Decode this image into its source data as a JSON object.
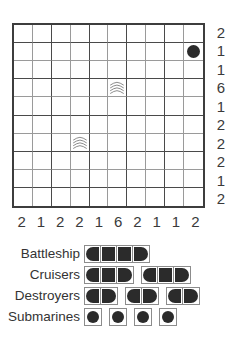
{
  "puzzle": {
    "name": "battleships-puzzle",
    "grid": {
      "rows": 10,
      "cols": 10
    },
    "row_clues": [
      2,
      1,
      1,
      6,
      1,
      2,
      2,
      2,
      1,
      2
    ],
    "col_clues": [
      2,
      1,
      2,
      2,
      1,
      6,
      2,
      1,
      1,
      2
    ],
    "markers": [
      {
        "type": "submarine",
        "row": 2,
        "col": 10,
        "icon": "filled-circle-icon"
      },
      {
        "type": "water",
        "row": 4,
        "col": 6,
        "icon": "waves-icon"
      },
      {
        "type": "water",
        "row": 7,
        "col": 4,
        "icon": "waves-icon"
      }
    ]
  },
  "fleet": {
    "name": "fleet-legend",
    "rows": [
      {
        "label": "Battleship",
        "count": 1,
        "size": 4
      },
      {
        "label": "Cruisers",
        "count": 2,
        "size": 3
      },
      {
        "label": "Destroyers",
        "count": 3,
        "size": 2
      },
      {
        "label": "Submarines",
        "count": 4,
        "size": 1
      }
    ]
  },
  "colors": {
    "ink": "#2b2b2b",
    "grid_line": "#9a9a9a",
    "grid_line_dark": "#4a4a4a",
    "border": "#3d3d3d",
    "text": "#3a3a3a",
    "background": "#ffffff"
  }
}
